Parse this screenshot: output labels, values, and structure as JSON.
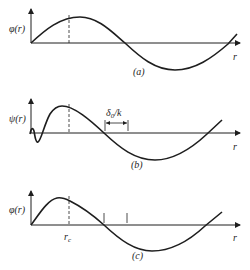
{
  "figure": {
    "panels": [
      {
        "id": "a",
        "caption": "(a)",
        "y_label": "φ(r)",
        "x_label": "r"
      },
      {
        "id": "b",
        "caption": "(b)",
        "y_label": "ψ(r)",
        "x_label": "r",
        "annotation": "δ0/k",
        "annotation_main": "δ",
        "annotation_sub": "0",
        "annotation_tail": "/k"
      },
      {
        "id": "c",
        "caption": "(c)",
        "y_label": "φ(r)",
        "x_label": "r",
        "marker_label_main": "r",
        "marker_label_sub": "c"
      }
    ],
    "colors": {
      "ink": "#1e1e1e",
      "background": "#ffffff"
    }
  }
}
